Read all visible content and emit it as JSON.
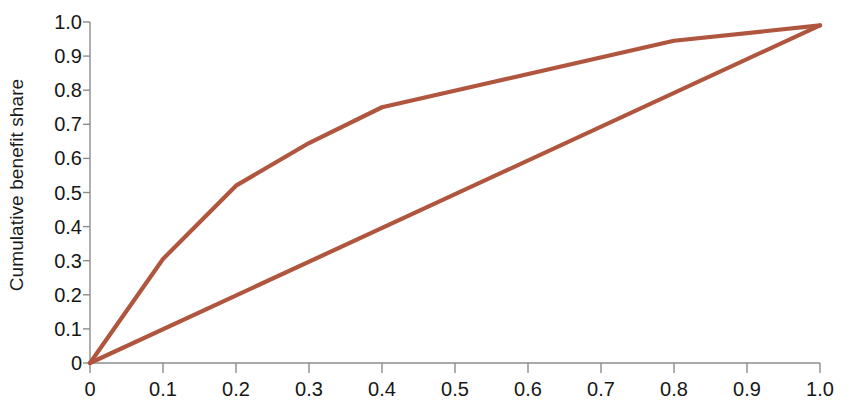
{
  "chart_data": {
    "type": "line",
    "title": "",
    "subtitle": "",
    "xlabel": "",
    "ylabel": "Cumulative benefit share",
    "xlim": [
      0,
      1.0
    ],
    "ylim": [
      0,
      1.0
    ],
    "grid": false,
    "legend": null,
    "legend_position": "none",
    "xticks": [
      0,
      0.1,
      0.2,
      0.3,
      0.4,
      0.5,
      0.6,
      0.7,
      0.8,
      0.9,
      1.0
    ],
    "xticklabels": [
      "0",
      "0.1",
      "0.2",
      "0.3",
      "0.4",
      "0.5",
      "0.6",
      "0.7",
      "0.8",
      "0.9",
      "1.0"
    ],
    "yticks": [
      0,
      0.1,
      0.2,
      0.3,
      0.4,
      0.5,
      0.6,
      0.7,
      0.8,
      0.9,
      1.0
    ],
    "yticklabels": [
      "0",
      "0.1",
      "0.2",
      "0.3",
      "0.4",
      "0.5",
      "0.6",
      "0.7",
      "0.8",
      "0.9",
      "1.0"
    ],
    "series": [
      {
        "name": "Concentration curve",
        "color": "#b0553e",
        "x": [
          0,
          0.1,
          0.2,
          0.3,
          0.4,
          0.8,
          1.0
        ],
        "y": [
          0,
          0.305,
          0.52,
          0.645,
          0.75,
          0.945,
          0.99
        ]
      },
      {
        "name": "Line of equality",
        "color": "#b0553e",
        "x": [
          0,
          1.0
        ],
        "y": [
          0,
          0.99
        ]
      }
    ]
  },
  "axes": {
    "line_color": "#8c8c8c",
    "tick_color": "#8c8c8c",
    "text_color": "#161616",
    "background": "#ffffff"
  }
}
